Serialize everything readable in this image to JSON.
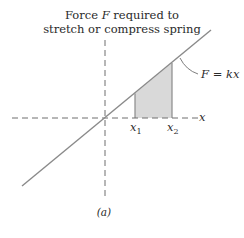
{
  "title_line1": "Force F required to",
  "title_line1_prefix": "Force ",
  "title_line1_var": "F",
  "title_line1_suffix": " required to",
  "title_line2": "stretch or compress spring",
  "equation_label": "F = kx",
  "axis_label_x": "x",
  "tick_x1": "x",
  "tick_x1_sub": "1",
  "tick_x2": "x",
  "tick_x2_sub": "2",
  "caption": "(a)",
  "colors": {
    "line": "#8a8a8a",
    "axis": "#6e6e6e",
    "shade": "#d9d9d9",
    "text": "#2a2a2a"
  }
}
